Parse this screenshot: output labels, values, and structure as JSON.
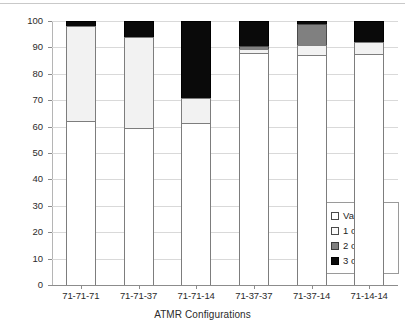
{
  "chart_data": {
    "type": "bar",
    "stacked": true,
    "title": "",
    "xlabel": "ATMR Configurations",
    "ylabel": "Error Distribution [%]",
    "ylim": [
      0,
      100
    ],
    "ytick_step": 10,
    "yticks": [
      "0",
      "10",
      "20",
      "30",
      "40",
      "50",
      "60",
      "70",
      "80",
      "90",
      "100"
    ],
    "grid": true,
    "legend_position": "inside-bottom-right",
    "categories": [
      "71-71-71",
      "71-71-37",
      "71-71-14",
      "71-37-37",
      "71-37-14",
      "71-14-14"
    ],
    "series": [
      {
        "name": "Vanished",
        "color": "#ffffff",
        "values": [
          62,
          59.5,
          61.5,
          88,
          87,
          87.5
        ]
      },
      {
        "name": "1 out of 3",
        "color": "#f2f2f2",
        "values": [
          36,
          34.5,
          9.5,
          1.5,
          4,
          4.5
        ]
      },
      {
        "name": "2 out of 3",
        "color": "#808080",
        "values": [
          0,
          0,
          0,
          1,
          8,
          0
        ]
      },
      {
        "name": "3 out of 3",
        "color": "#0a0a0a",
        "values": [
          2,
          6,
          29,
          9.5,
          1,
          8
        ]
      }
    ]
  },
  "legend": {
    "items": [
      {
        "label": "Vanished",
        "swatch": "white-square-icon"
      },
      {
        "label": "1 out of 3",
        "swatch": "light-square-icon"
      },
      {
        "label": "2 out of 3",
        "swatch": "gray-square-icon"
      },
      {
        "label": "3 out of 3",
        "swatch": "black-square-icon"
      }
    ]
  },
  "colors": {
    "vanished": "#ffffff",
    "one_of_three": "#f2f2f2",
    "two_of_three": "#808080",
    "three_of_three": "#0a0a0a",
    "gridline": "#d9d9d9",
    "axis": "#8c8c8c",
    "text": "#2b2b2b"
  }
}
